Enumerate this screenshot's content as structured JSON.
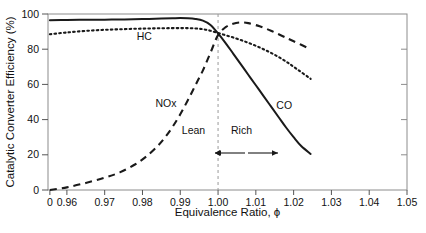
{
  "chart_data": {
    "type": "line",
    "title": "",
    "xlabel": "Equivalence Ratio, ϕ",
    "ylabel": "Catalytic Converter Efficiency (%)",
    "xlim": [
      0.955,
      1.05
    ],
    "ylim": [
      0,
      100
    ],
    "grid": false,
    "legend_position": "inline-labels",
    "x_ticks": [
      "0",
      "0.96",
      "0.97",
      "0.98",
      "0.99",
      "1.00",
      "1.01",
      "1.02",
      "1.03",
      "1.04",
      "1.05"
    ],
    "x_tick_values": [
      0.9555,
      0.96,
      0.97,
      0.98,
      0.99,
      1.0,
      1.01,
      1.02,
      1.03,
      1.04,
      1.05
    ],
    "y_ticks": [
      "0",
      "20",
      "40",
      "60",
      "80",
      "100"
    ],
    "y_tick_values": [
      0,
      20,
      40,
      60,
      80,
      100
    ],
    "axis_break_note": "x-axis compressed between 0 and 0.96",
    "series": [
      {
        "name": "CO",
        "style": "solid",
        "color": "#1a1a1a",
        "label": "CO",
        "label_x": 1.0175,
        "label_y": 46,
        "x": [
          0.9555,
          0.96,
          0.965,
          0.97,
          0.975,
          0.98,
          0.985,
          0.988,
          0.99,
          0.992,
          0.994,
          0.996,
          0.998,
          1.0,
          1.002,
          1.004,
          1.006,
          1.008,
          1.01,
          1.012,
          1.014,
          1.016,
          1.018,
          1.02,
          1.022,
          1.0245
        ],
        "y": [
          96.5,
          96.6,
          96.7,
          96.8,
          96.9,
          97.1,
          97.4,
          97.6,
          97.7,
          97.6,
          97.2,
          96.2,
          93.8,
          89.0,
          83.5,
          77.5,
          71.5,
          65.5,
          59.5,
          53.5,
          47.5,
          41.5,
          35.5,
          30.0,
          25.0,
          20.5
        ]
      },
      {
        "name": "HC",
        "style": "dotted",
        "color": "#1a1a1a",
        "label": "HC",
        "label_x": 0.9805,
        "label_y": 85,
        "x": [
          0.9555,
          0.96,
          0.965,
          0.97,
          0.975,
          0.98,
          0.985,
          0.99,
          0.994,
          0.997,
          1.0,
          1.003,
          1.006,
          1.009,
          1.012,
          1.015,
          1.018,
          1.021,
          1.0245
        ],
        "y": [
          88.5,
          89.5,
          90.4,
          91.0,
          91.4,
          91.7,
          91.9,
          92.0,
          91.8,
          91.0,
          89.2,
          87.3,
          85.2,
          82.8,
          80.0,
          76.8,
          73.0,
          68.5,
          63.2
        ]
      },
      {
        "name": "NOx",
        "style": "dashed",
        "color": "#1a1a1a",
        "label": "NOx",
        "label_x": 0.9862,
        "label_y": 47,
        "x": [
          0.9555,
          0.96,
          0.965,
          0.97,
          0.974,
          0.978,
          0.981,
          0.984,
          0.986,
          0.988,
          0.99,
          0.992,
          0.994,
          0.996,
          0.998,
          1.0,
          1.002,
          1.004,
          1.006,
          1.008,
          1.011,
          1.014,
          1.017,
          1.02,
          1.0245
        ],
        "y": [
          0.0,
          1.5,
          4.0,
          7.0,
          10.0,
          14.5,
          19.0,
          25.0,
          30.0,
          36.0,
          43.0,
          51.0,
          59.5,
          68.0,
          78.0,
          88.0,
          92.5,
          94.5,
          95.2,
          94.8,
          93.0,
          90.5,
          87.5,
          84.5,
          80.0
        ]
      }
    ],
    "reference_line": {
      "name": "stoichiometric",
      "x": 1.0,
      "style": "dashed",
      "color": "#9a9a9a"
    },
    "annotations": [
      {
        "name": "lean",
        "text": "Lean",
        "x": 0.9935,
        "y": 32
      },
      {
        "name": "rich",
        "text": "Rich",
        "x": 1.0062,
        "y": 32
      },
      {
        "name": "lean-arrow",
        "direction": "left"
      },
      {
        "name": "rich-arrow",
        "direction": "right"
      }
    ]
  }
}
